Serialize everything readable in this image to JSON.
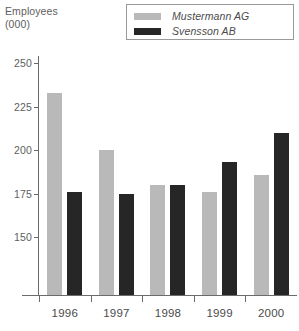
{
  "axis_title": {
    "line1": "Employees",
    "line2": "(000)"
  },
  "legend": {
    "position": "top-right",
    "entries": [
      {
        "label": "Mustermann AG",
        "color": "#b9b9b9",
        "swatch_name": "legend-swatch-mustermann"
      },
      {
        "label": "Svensson AB",
        "color": "#262626",
        "swatch_name": "legend-swatch-svensson"
      }
    ]
  },
  "chart_data": {
    "type": "bar",
    "title": "",
    "subtitle": "",
    "xlabel": "",
    "ylabel": "Employees (000)",
    "categories": [
      "1996",
      "1997",
      "1998",
      "1999",
      "2000"
    ],
    "series": [
      {
        "name": "Mustermann AG",
        "color": "#b9b9b9",
        "values": [
          233,
          200,
          180,
          176,
          186
        ]
      },
      {
        "name": "Svensson AB",
        "color": "#262626",
        "values": [
          176,
          175,
          180,
          193,
          210
        ]
      }
    ],
    "yticks": [
      150,
      175,
      200,
      225,
      250
    ],
    "ylim": [
      117,
      254
    ],
    "ytick_labels": [
      "150",
      "175",
      "200",
      "225",
      "250"
    ],
    "grid": false,
    "legend_position": "top-right",
    "axis_color": "#6b6b6b",
    "text_color": "#5a5a5a",
    "background": "#ffffff"
  }
}
